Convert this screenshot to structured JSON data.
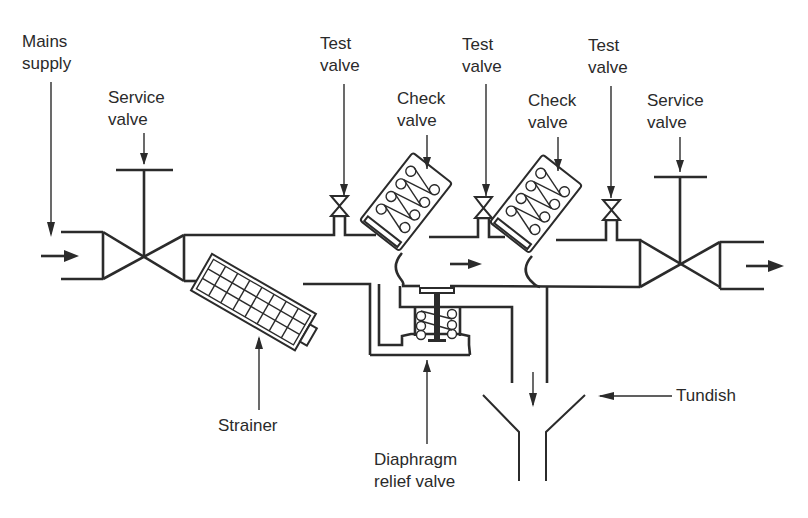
{
  "diagram": {
    "title": "",
    "type": "backflow prevention device (reduced pressure zone valve)",
    "labels": {
      "mains_supply": [
        "Mains",
        "supply"
      ],
      "service_valve_inlet": [
        "Service",
        "valve"
      ],
      "test_valve_1": [
        "Test",
        "valve"
      ],
      "check_valve_1": [
        "Check",
        "valve"
      ],
      "test_valve_2": [
        "Test",
        "valve"
      ],
      "check_valve_2": [
        "Check",
        "valve"
      ],
      "test_valve_3": [
        "Test",
        "valve"
      ],
      "service_valve_outlet": [
        "Service",
        "valve"
      ],
      "strainer": "Strainer",
      "diaphragm_relief_valve": [
        "Diaphragm",
        "relief valve"
      ],
      "tundish": "Tundish"
    },
    "components": [
      {
        "id": "inlet-pipe",
        "label": "Mains supply"
      },
      {
        "id": "service-valve-inlet",
        "label": "Service valve"
      },
      {
        "id": "strainer",
        "label": "Strainer"
      },
      {
        "id": "test-valve-1",
        "label": "Test valve"
      },
      {
        "id": "check-valve-1",
        "label": "Check valve"
      },
      {
        "id": "test-valve-2",
        "label": "Test valve"
      },
      {
        "id": "check-valve-2",
        "label": "Check valve"
      },
      {
        "id": "test-valve-3",
        "label": "Test valve"
      },
      {
        "id": "service-valve-outlet",
        "label": "Service valve"
      },
      {
        "id": "diaphragm-relief-valve",
        "label": "Diaphragm relief valve"
      },
      {
        "id": "tundish",
        "label": "Tundish"
      }
    ],
    "flow_direction": "left-to-right",
    "colors": {
      "line": "#2b2b2b",
      "background": "#ffffff",
      "text": "#2a2a2a"
    }
  }
}
